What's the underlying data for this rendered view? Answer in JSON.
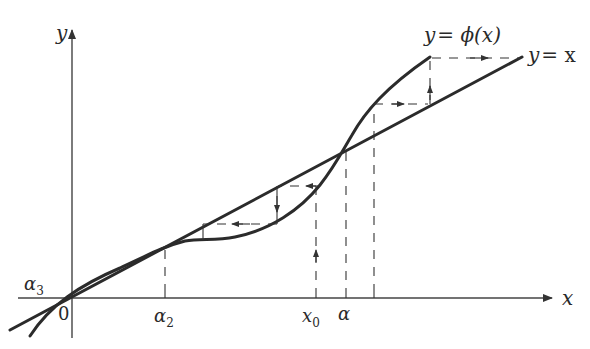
{
  "figure": {
    "axes": {
      "x_label": "x",
      "y_label": "y",
      "origin_label": "0"
    },
    "curves": [
      {
        "name": "identity-line",
        "label": "y = x"
      },
      {
        "name": "phi-curve",
        "label": "y = ϕ(x)"
      }
    ],
    "x_axis_marks": [
      {
        "name": "alpha2",
        "label": "α2",
        "base": "α",
        "sub": "2"
      },
      {
        "name": "x0",
        "label": "x0",
        "base": "x",
        "sub": "0"
      },
      {
        "name": "alpha",
        "label": "α",
        "base": "α",
        "sub": ""
      }
    ],
    "point_labels": [
      {
        "name": "alpha3",
        "label": "α3",
        "base": "α",
        "sub": "3"
      }
    ],
    "labels": {
      "y_axis": "y",
      "x_axis": "x",
      "origin": "0",
      "phi_curve": "y = ϕ(x)",
      "phi_prefix": "y",
      "phi_eq": "= ",
      "phi_func": "ϕ(x)",
      "identity_prefix": "y",
      "identity_rest": "= x",
      "alpha3_base": "α",
      "alpha3_sub": "3",
      "alpha2_base": "α",
      "alpha2_sub": "2",
      "x0_base": "x",
      "x0_sub": "0",
      "alpha_base": "α"
    }
  }
}
